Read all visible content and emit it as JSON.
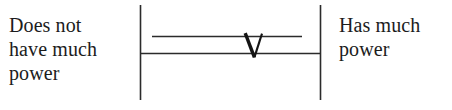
{
  "item": {
    "type": "semantic-differential-rating-scale",
    "orientation": "horizontal",
    "anchor_low": "Does not\nhave much\npower",
    "anchor_high": "Has much\npower",
    "response_mark": "V",
    "response_mark_kind": "handwritten-check",
    "colors": {
      "background": "#ffffff",
      "ink": "#1c1c1c",
      "rule": "#2b2b2b"
    }
  },
  "geometry": {
    "left_end_bar_x": 140,
    "right_end_bar_x": 320,
    "end_bar_top_y": 5,
    "end_bar_bottom_y": 100,
    "response_line_y": 36,
    "response_line_x1": 152,
    "response_line_x2": 302,
    "baseline_y": 53,
    "baseline_x1": 140,
    "baseline_x2": 320,
    "mark_x1": 245,
    "mark_apex_x": 254,
    "mark_x2": 262,
    "mark_top_y": 33,
    "mark_apex_y": 57,
    "mark_position_fraction": 0.63
  }
}
